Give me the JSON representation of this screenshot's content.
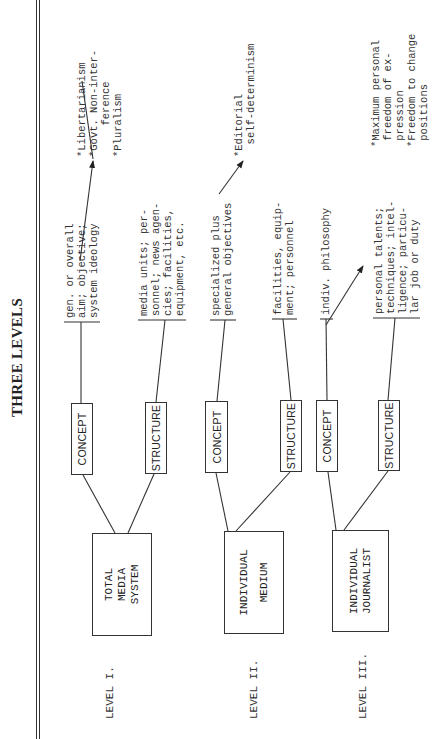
{
  "title": "THREE LEVELS",
  "levels": [
    {
      "label": "LEVEL I.",
      "entity": [
        "TOTAL",
        "MEDIA",
        "SYSTEM"
      ],
      "concept": {
        "label": "CONCEPT",
        "description": "gen. or overall\naim; objective;\nsystem ideology"
      },
      "structure": {
        "label": "STRUCTURE",
        "description": "media units; per-\nsonnel; news agen-\ncies; facilities,\nequipment, etc."
      },
      "outcome": "*Libertarianism\n*Govt. Non-inter-\n     ference\n*Pluralism"
    },
    {
      "label": "LEVEL II.",
      "entity": [
        "INDIVIDUAL",
        "MEDIUM"
      ],
      "concept": {
        "label": "CONCEPT",
        "description": "specialized plus\ngeneral objectives"
      },
      "structure": {
        "label": "STRUCTURE",
        "description": "facilities, equip-\nment; personnel"
      },
      "outcome": "*Editorial\n  self-determinism"
    },
    {
      "label": "LEVEL III.",
      "entity": [
        "INDIVIDUAL",
        "JOURNALIST"
      ],
      "concept": {
        "label": "CONCEPT",
        "description": "indiv. philosophy"
      },
      "structure": {
        "label": "STRUCTURE",
        "description": "personal talents;\ntechniques; intel-\nligence; particu-\nlar job or duty"
      },
      "outcome": "*Maximum personal\n freedom of ex-\n pression\n*Freedom to change\n positions"
    }
  ]
}
